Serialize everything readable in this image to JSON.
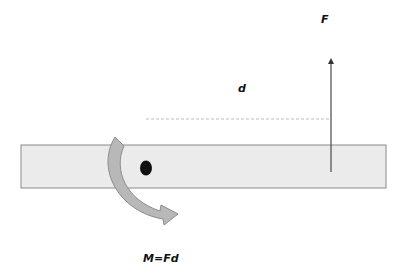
{
  "diagram": {
    "labels": {
      "force": "F",
      "distance": "d",
      "moment": "M=Fd"
    },
    "colors": {
      "beam_fill": "#ebebeb",
      "beam_stroke": "#8a8a8a",
      "arrow_fill": "#b8b8b8",
      "arrow_stroke": "#8c8c8c",
      "force_line": "#444444",
      "pivot": "#111111",
      "dashed_line": "#bbbbbb"
    },
    "elements": [
      "beam",
      "pivot",
      "force-arrow",
      "distance-line",
      "moment-arrow"
    ]
  }
}
